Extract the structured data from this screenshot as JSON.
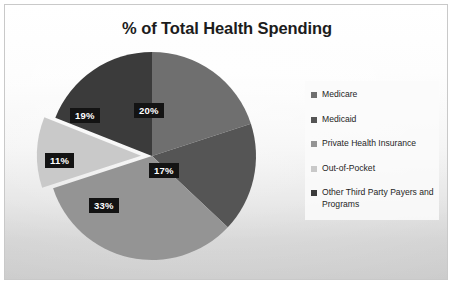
{
  "chart_data": {
    "type": "pie",
    "title": "% of Total Health Spending",
    "xlabel": "",
    "ylabel": "",
    "legend_position": "right",
    "grid": false,
    "exploded_slices": [
      "Out-of-Pocket"
    ],
    "categories": [
      "Medicare",
      "Medicaid",
      "Private Health Insurance",
      "Out-of-Pocket",
      "Other Third Party Payers and Programs"
    ],
    "values": [
      20,
      17,
      33,
      11,
      19
    ],
    "value_labels": [
      "20%",
      "17%",
      "33%",
      "11%",
      "19%"
    ],
    "colors": [
      "#6f6f6f",
      "#555555",
      "#949494",
      "#c9c9c9",
      "#3b3b3b"
    ],
    "slices": [
      {
        "label": "Medicare",
        "value": 20,
        "display": "20%",
        "color": "#6f6f6f",
        "exploded": false
      },
      {
        "label": "Medicaid",
        "value": 17,
        "display": "17%",
        "color": "#555555",
        "exploded": false
      },
      {
        "label": "Private Health Insurance",
        "value": 33,
        "display": "33%",
        "color": "#949494",
        "exploded": false
      },
      {
        "label": "Out-of-Pocket",
        "value": 11,
        "display": "11%",
        "color": "#c9c9c9",
        "exploded": true
      },
      {
        "label": "Other Third Party Payers and Programs",
        "value": 19,
        "display": "19%",
        "color": "#3b3b3b",
        "exploded": false
      }
    ]
  },
  "title": "% of Total Health Spending",
  "legend": {
    "items": [
      {
        "label": "Medicare",
        "color": "#6f6f6f"
      },
      {
        "label": "Medicaid",
        "color": "#555555"
      },
      {
        "label": "Private Health Insurance",
        "color": "#949494"
      },
      {
        "label": "Out-of-Pocket",
        "color": "#c9c9c9"
      },
      {
        "label": "Other Third Party Payers and Programs",
        "color": "#3b3b3b"
      }
    ]
  },
  "labels": {
    "medicare": "20%",
    "medicaid": "17%",
    "private": "33%",
    "oop": "11%",
    "other": "19%"
  }
}
